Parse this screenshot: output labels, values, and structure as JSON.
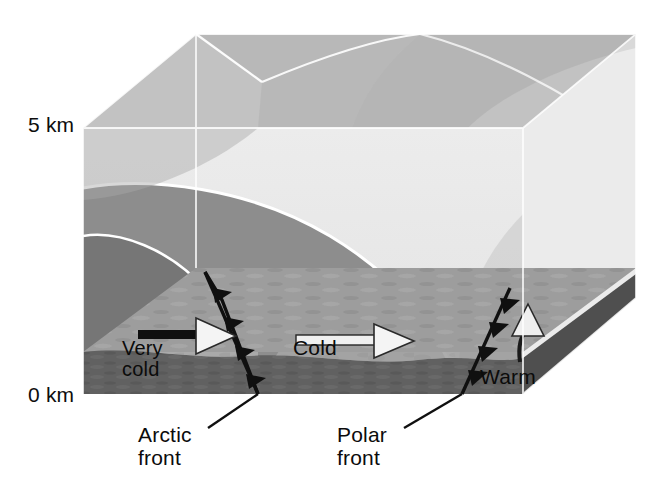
{
  "figure": {
    "type": "meteorological-cross-section-block"
  },
  "axis": {
    "vertical_ticks": [
      {
        "id": "top",
        "label": "5 km"
      },
      {
        "id": "bottom",
        "label": "0 km"
      }
    ]
  },
  "air_masses": [
    {
      "id": "very-cold",
      "label": "Very\ncold",
      "fill": "#767676",
      "position": "leftmost innermost dome"
    },
    {
      "id": "cold",
      "label": "Cold",
      "fill": "#8d8d8d",
      "position": "middle dome between arctic and polar fronts"
    },
    {
      "id": "warm",
      "label": "Warm",
      "fill": "#a8a8a8",
      "position": "right of the polar front"
    }
  ],
  "fronts": [
    {
      "id": "arctic-front",
      "label": "Arctic\nfront",
      "symbol": "cold-front-barbs",
      "color": "#111111"
    },
    {
      "id": "polar-front",
      "label": "Polar\nfront",
      "symbol": "cold-front-barbs",
      "color": "#111111"
    }
  ],
  "flow_arrows": [
    {
      "id": "very-cold-arrow",
      "direction": "right",
      "style": "white-filled-outlined"
    },
    {
      "id": "cold-arrow",
      "direction": "right",
      "style": "white-filled-outlined"
    },
    {
      "id": "warm-arrow",
      "direction": "up-curved",
      "style": "white-filled-outlined"
    }
  ],
  "colors": {
    "background": "#ffffff",
    "sky": "#e9e9e9",
    "box_top_left": "#c0c0c0",
    "box_top_right": "#b4b4b4",
    "ground_surface": "#9a9a9a",
    "ground_slab": "#5f5f5f",
    "cloud_white": "#f2f2f2",
    "edge_line": "#ffffff",
    "front_line": "#0f0f0f"
  }
}
